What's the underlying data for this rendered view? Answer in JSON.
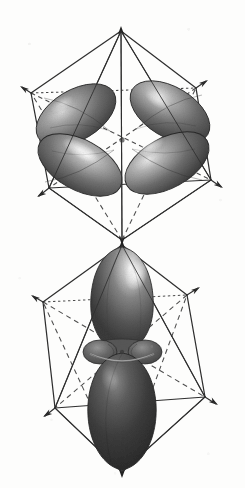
{
  "figure": {
    "background_color": "#fdfdfc",
    "ink_color": "#2e2e2e",
    "orbital_dark": "#4a4a4a",
    "orbital_mid": "#6f6f6f",
    "orbital_light": "#f2f2f2",
    "style": "grayscale scanned textbook line art"
  },
  "panels": [
    {
      "id": "upper",
      "name": "d x2-y2 orbital in octahedron",
      "orbital_label": "dx2-y2",
      "lobe_count": 4,
      "has_torus": false,
      "center": {
        "x": 122,
        "y": 140
      },
      "octahedron": {
        "apex_top": {
          "x": 121,
          "y": 31
        },
        "apex_bottom": {
          "x": 122,
          "y": 240
        },
        "back_left": {
          "x": 31,
          "y": 93
        },
        "back_right": {
          "x": 196,
          "y": 88
        },
        "front_left": {
          "x": 49,
          "y": 188
        },
        "front_right": {
          "x": 211,
          "y": 180
        },
        "arrow_count": 6,
        "hidden_edges_dashed": true
      }
    },
    {
      "id": "lower",
      "name": "dz2 orbital in octahedron",
      "orbital_label": "dz2",
      "lobe_count": 2,
      "has_torus": true,
      "center": {
        "x": 122,
        "y": 353
      },
      "octahedron": {
        "apex_top": {
          "x": 122,
          "y": 245
        },
        "apex_bottom": {
          "x": 122,
          "y": 472
        },
        "back_left": {
          "x": 43,
          "y": 302
        },
        "back_right": {
          "x": 187,
          "y": 295
        },
        "front_left": {
          "x": 55,
          "y": 408
        },
        "front_right": {
          "x": 205,
          "y": 397
        },
        "arrow_count": 6,
        "hidden_edges_dashed": true
      }
    }
  ],
  "ghost_marks": [
    {
      "text": "",
      "x": 18,
      "y": 196
    },
    {
      "text": "",
      "x": 150,
      "y": 212
    },
    {
      "text": "",
      "x": 26,
      "y": 268
    },
    {
      "text": "",
      "x": 176,
      "y": 258
    },
    {
      "text": "",
      "x": 30,
      "y": 446
    },
    {
      "text": "",
      "x": 168,
      "y": 458
    }
  ]
}
